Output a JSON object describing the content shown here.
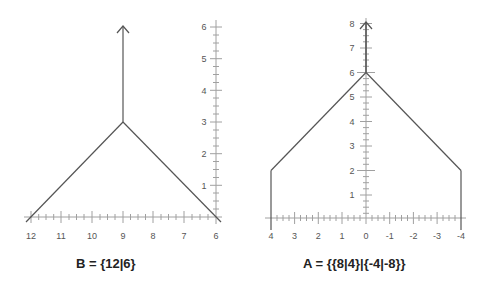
{
  "diagrams": [
    {
      "id": "B",
      "caption": "B = {12|6}",
      "x_ticks": [
        "12",
        "11",
        "10",
        "9",
        "8",
        "7",
        "6"
      ],
      "y_ticks": [
        "1",
        "2",
        "3",
        "4",
        "5",
        "6"
      ],
      "x_range": [
        12,
        6
      ],
      "y_range": [
        0,
        6
      ],
      "edges": [
        {
          "from": [
            12,
            0
          ],
          "to": [
            9,
            3
          ]
        },
        {
          "from": [
            9,
            3
          ],
          "to": [
            6,
            0
          ]
        },
        {
          "from": [
            9,
            3
          ],
          "to": [
            9,
            6
          ],
          "arrow": true
        }
      ]
    },
    {
      "id": "A",
      "caption": "A = {{8|4}|{-4|-8}}",
      "x_ticks": [
        "4",
        "3",
        "2",
        "1",
        "0",
        "-1",
        "-2",
        "-3",
        "-4"
      ],
      "y_ticks": [
        "1",
        "2",
        "3",
        "4",
        "5",
        "6",
        "7",
        "8"
      ],
      "x_range": [
        4,
        -4
      ],
      "y_range": [
        0,
        8
      ],
      "edges": [
        {
          "from": [
            4,
            -0.5
          ],
          "to": [
            4,
            2
          ]
        },
        {
          "from": [
            4,
            2
          ],
          "to": [
            0,
            6
          ]
        },
        {
          "from": [
            0,
            6
          ],
          "to": [
            -4,
            2
          ]
        },
        {
          "from": [
            -4,
            2
          ],
          "to": [
            -4,
            -0.5
          ]
        },
        {
          "from": [
            0,
            6
          ],
          "to": [
            0,
            8
          ],
          "arrow": true
        }
      ]
    }
  ],
  "colors": {
    "line": "#555555",
    "axis": "#9a9a9a",
    "label": "#555555",
    "caption": "#222222"
  }
}
